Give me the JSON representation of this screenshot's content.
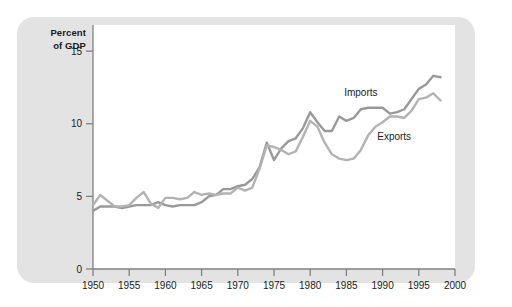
{
  "figure": {
    "background": "#ffffff",
    "card_color": "#e3e3e3",
    "plot_background": "#ffffff",
    "axis_color": "#808080"
  },
  "axis_title": {
    "line1": "Percent",
    "line2": "of GDP"
  },
  "chart_data": {
    "type": "line",
    "title": "",
    "subtitle": "",
    "xlabel": "",
    "ylabel": "Percent of GDP",
    "xlim": [
      1950,
      2000
    ],
    "ylim": [
      0,
      16.8
    ],
    "xticks": [
      1950,
      1955,
      1960,
      1965,
      1970,
      1975,
      1980,
      1985,
      1990,
      1995,
      2000
    ],
    "xtick_labels": [
      "1950",
      "1955",
      "1960",
      "1965",
      "1970",
      "1975",
      "1980",
      "1985",
      "1990",
      "1995",
      "2000"
    ],
    "yticks": [
      0,
      5,
      10,
      15
    ],
    "ytick_labels": [
      "0",
      "5",
      "10",
      "15"
    ],
    "grid": false,
    "legend_position": "inline-annotations",
    "annotations": [
      {
        "text": "Imports",
        "x": 1987.0,
        "y": 11.9
      },
      {
        "text": "Exports",
        "x": 1991.6,
        "y": 8.9
      }
    ],
    "x": [
      1950,
      1951,
      1952,
      1953,
      1954,
      1955,
      1956,
      1957,
      1958,
      1959,
      1960,
      1961,
      1962,
      1963,
      1964,
      1965,
      1966,
      1967,
      1968,
      1969,
      1970,
      1971,
      1972,
      1973,
      1974,
      1975,
      1976,
      1977,
      1978,
      1979,
      1980,
      1981,
      1982,
      1983,
      1984,
      1985,
      1986,
      1987,
      1988,
      1989,
      1990,
      1991,
      1992,
      1993,
      1994,
      1995,
      1996,
      1997,
      1998
    ],
    "series": [
      {
        "name": "Imports",
        "color": "#999999",
        "values": [
          4.0,
          4.3,
          4.3,
          4.3,
          4.2,
          4.3,
          4.4,
          4.4,
          4.4,
          4.6,
          4.4,
          4.3,
          4.4,
          4.4,
          4.4,
          4.6,
          5.0,
          5.1,
          5.5,
          5.5,
          5.7,
          5.8,
          6.2,
          7.0,
          8.7,
          7.5,
          8.3,
          8.8,
          9.0,
          9.7,
          10.8,
          10.1,
          9.5,
          9.5,
          10.5,
          10.2,
          10.4,
          11.0,
          11.1,
          11.1,
          11.1,
          10.7,
          10.8,
          11.0,
          11.7,
          12.4,
          12.7,
          13.3,
          13.2
        ]
      },
      {
        "name": "Exports",
        "color": "#b3b3b3",
        "values": [
          4.4,
          5.1,
          4.7,
          4.3,
          4.3,
          4.4,
          4.9,
          5.3,
          4.5,
          4.2,
          4.9,
          4.9,
          4.8,
          4.9,
          5.3,
          5.1,
          5.2,
          5.1,
          5.2,
          5.2,
          5.6,
          5.4,
          5.6,
          6.9,
          8.5,
          8.4,
          8.2,
          7.9,
          8.1,
          9.1,
          10.2,
          9.8,
          8.7,
          7.9,
          7.6,
          7.5,
          7.6,
          8.2,
          9.2,
          9.8,
          10.1,
          10.5,
          10.5,
          10.4,
          10.9,
          11.7,
          11.8,
          12.1,
          11.6
        ]
      }
    ]
  }
}
